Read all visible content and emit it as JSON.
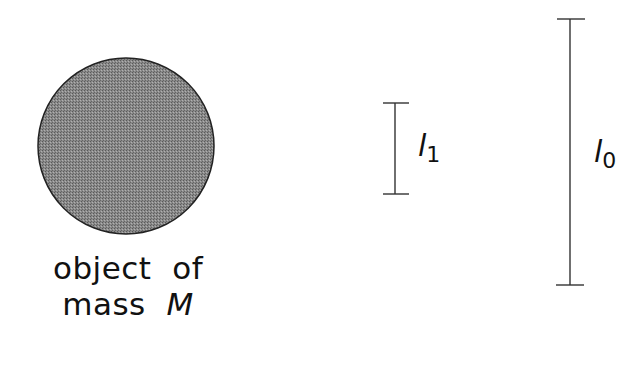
{
  "figure": {
    "object": {
      "shape": "circle",
      "fill": "#7c7c7c",
      "stroke": "#222222",
      "caption_line1": "object  of",
      "caption_line2_text": "mass  ",
      "caption_mass_symbol": "M"
    },
    "bars": [
      {
        "id": "l1",
        "symbol": "l",
        "subscript": "1"
      },
      {
        "id": "l0",
        "symbol": "l",
        "subscript": "0"
      }
    ],
    "line_color": "#333333"
  }
}
